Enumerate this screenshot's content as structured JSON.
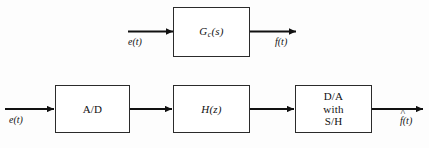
{
  "figure": {
    "type": "block-diagram",
    "background_color": "#fdfdfd",
    "line_color": "#111111",
    "block_border_color": "#2b2b2b",
    "block_fill_color": "#ffffff",
    "rows": [
      {
        "id": "continuous-row",
        "input_label": "e(t)",
        "block_label": "G",
        "block_subscript": "c",
        "block_argument": "(s)",
        "output_label": "f(t)"
      },
      {
        "id": "digital-row",
        "input_label": "e(t)",
        "output_label_base": "f",
        "output_label_hat": "^",
        "output_label_arg": "(t)",
        "blocks": [
          {
            "id": "ad-block",
            "label": "A/D"
          },
          {
            "id": "hz-block",
            "label_base": "H",
            "label_arg": "(z)"
          },
          {
            "id": "da-block",
            "line1": "D/A",
            "line2": "with",
            "line3": "S/H"
          }
        ]
      }
    ]
  }
}
